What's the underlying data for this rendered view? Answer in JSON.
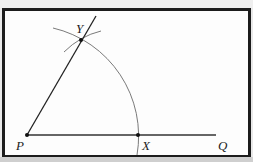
{
  "diagram": {
    "title": "",
    "colors": {
      "frame_border": "#1c1c1c",
      "background": "#fdfdfd",
      "line": "#222222",
      "arc": "#7a7a7a"
    },
    "points": {
      "P": {
        "label": "P",
        "x": 27,
        "y": 135
      },
      "X": {
        "label": "X",
        "x": 138,
        "y": 135
      },
      "Y": {
        "label": "Y",
        "x": 81,
        "y": 40
      },
      "Q": {
        "label": "Q",
        "x": 216,
        "y": 135
      }
    },
    "segments": [
      {
        "name": "ray-PQ",
        "from": "P",
        "to": "Q"
      },
      {
        "name": "ray-PY",
        "from": "P",
        "through": "Y"
      }
    ],
    "arcs": [
      {
        "name": "arc-centered-P",
        "center": "P",
        "radius": 111
      },
      {
        "name": "arc-through-Y",
        "description": "short intersecting arc at Y"
      }
    ],
    "labels": {
      "p": "P",
      "x": "X",
      "y": "Y",
      "q": "Q"
    }
  }
}
